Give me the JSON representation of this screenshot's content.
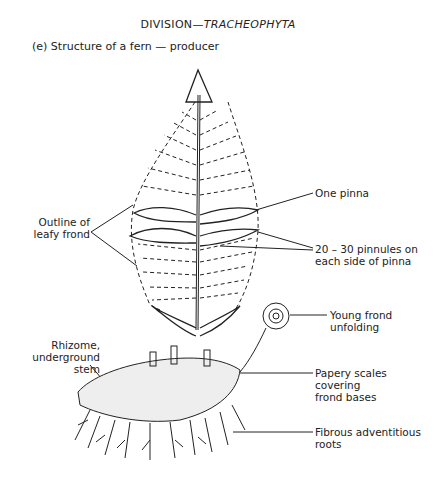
{
  "header": {
    "division_prefix": "DIVISION—",
    "division_name": "TRACHEOPHYTA",
    "subtitle": "(e) Structure of a fern — producer"
  },
  "labels": {
    "outline_frond": "Outline of\nleafy frond",
    "one_pinna": "One pinna",
    "pinnules": "20 – 30 pinnules on\neach side of pinna",
    "young_frond": "Young frond\nunfolding",
    "rhizome": "Rhizome,\nunderground\nstem",
    "papery_scales": "Papery scales\ncovering\nfrond bases",
    "roots": "Fibrous adventitious\nroots"
  }
}
